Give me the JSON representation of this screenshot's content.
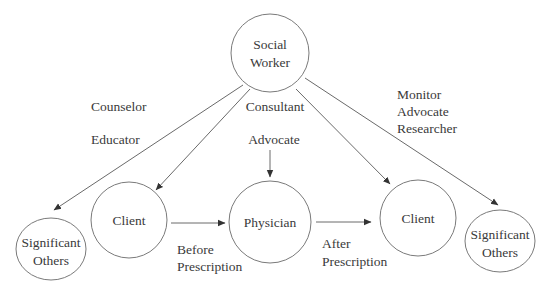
{
  "diagram": {
    "nodes": {
      "social_worker": {
        "line1": "Social",
        "line2": "Worker"
      },
      "client_left": {
        "label": "Client"
      },
      "physician": {
        "label": "Physician"
      },
      "client_right": {
        "label": "Client"
      },
      "significant_others_left": {
        "line1": "Significant",
        "line2": "Others"
      },
      "significant_others_right": {
        "line1": "Significant",
        "line2": "Others"
      }
    },
    "role_labels": {
      "counselor": "Counselor",
      "educator": "Educator",
      "consultant": "Consultant",
      "advocate_center": "Advocate",
      "right_group": [
        "Monitor",
        "Advocate",
        "Researcher"
      ]
    },
    "edge_labels": {
      "before_prescription": [
        "Before",
        "Prescription"
      ],
      "after_prescription": [
        "After",
        "Prescription"
      ]
    },
    "edges": [
      {
        "from": "Social Worker",
        "to": "Significant Others (left)"
      },
      {
        "from": "Social Worker",
        "to": "Client (left)"
      },
      {
        "from": "Advocate",
        "to": "Physician"
      },
      {
        "from": "Social Worker",
        "to": "Client (right)"
      },
      {
        "from": "Social Worker",
        "to": "Significant Others (right)"
      },
      {
        "from": "Client (left)",
        "to": "Physician",
        "label": "Before Prescription"
      },
      {
        "from": "Physician",
        "to": "Client (right)",
        "label": "After Prescription"
      }
    ],
    "colors": {
      "stroke": "#7a7a7a",
      "text": "#3a3a3a",
      "background": "#ffffff"
    }
  }
}
